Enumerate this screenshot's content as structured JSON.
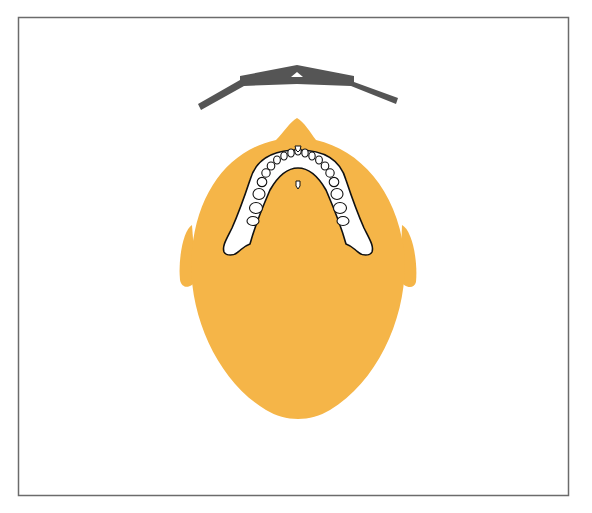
{
  "diagram": {
    "title": "Panoramic radiography principle",
    "description": "Top-down view of head with X-ray tube and film rotating around the jaw; rays converge at the rotation center, tooth images are projected onto the film",
    "colors": {
      "frame": "#6b6b6b",
      "head": "#f5b548",
      "film": "#555555",
      "rays": "#e8436b",
      "arrows": "#3fc4ea",
      "tube": "#b8795e",
      "bone": "#ffffff",
      "outline": "#111111"
    },
    "labels": {
      "film": "Film cassette",
      "tube": "X-ray tube",
      "head": "Patient head",
      "mandible": "Mandible",
      "rotation_top": "Film rotation",
      "rotation_bottom": "Tube rotation",
      "tooth_images": [
        "Projected tooth image 1",
        "Projected tooth image 2",
        "Projected tooth image 3"
      ]
    }
  }
}
